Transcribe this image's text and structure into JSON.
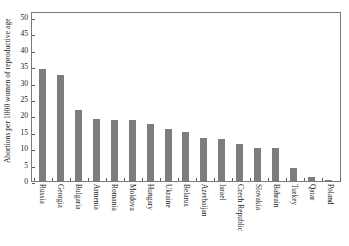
{
  "chart_data": {
    "type": "bar",
    "title": "",
    "xlabel": "",
    "ylabel": "Abortions per 1000 women of reproductive age",
    "ylim": [
      0,
      50
    ],
    "yticks": [
      0,
      5,
      10,
      15,
      20,
      25,
      30,
      35,
      40,
      45,
      50
    ],
    "ytick_labels": [
      "0",
      "5",
      "10",
      "15",
      "20",
      "25",
      "30",
      "35",
      "40",
      "45",
      "50"
    ],
    "grid": false,
    "legend": null,
    "bar_color": "#7d7d7d",
    "axis_color": "#7a7a7a",
    "categories": [
      "Russia",
      "Georgia",
      "Bulgaria",
      "Armenia",
      "Romania",
      "Moldova",
      "Hungary",
      "Ukraine",
      "Belarus",
      "Azerbaijan",
      "Israel",
      "Czech Republic",
      "Slovakia",
      "Bahrain",
      "Turkey",
      "Qatar",
      "Poland"
    ],
    "values": [
      34.0,
      32.4,
      21.5,
      19.0,
      18.6,
      18.5,
      17.5,
      16.0,
      15.0,
      13.2,
      12.8,
      11.4,
      10.2,
      10.1,
      4.0,
      1.3,
      0.2
    ]
  }
}
